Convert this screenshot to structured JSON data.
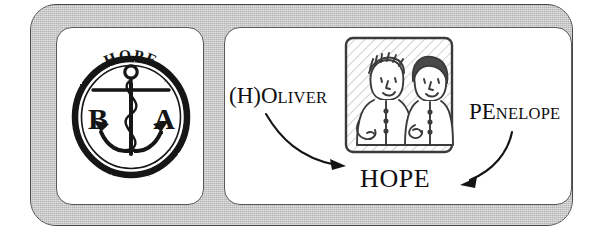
{
  "figure": {
    "frame_color": "#b6b6b6",
    "panel_color": "#ffffff",
    "ink_color": "#100f10"
  },
  "seal_panel": {
    "name": "hope-anchor-seal",
    "top_text": "HOPE",
    "left_letter": "B",
    "right_letter": "A",
    "emblem": "anchor"
  },
  "derivation_panel": {
    "source_left": {
      "large": "(H)O",
      "small": "LIVER",
      "full": "(H)OLIVER"
    },
    "source_right": {
      "large": "PE",
      "small": "NELOPE",
      "full": "PENELOPE"
    },
    "result": "HOPE",
    "photo": {
      "name": "couple-photo-sketch",
      "subjects": 2,
      "description": "hand-drawn sketch of two people side by side"
    },
    "arrows": [
      {
        "name": "arrow-oliver-to-hope",
        "direction": "down-right"
      },
      {
        "name": "arrow-penelope-to-hope",
        "direction": "down-left"
      }
    ]
  }
}
